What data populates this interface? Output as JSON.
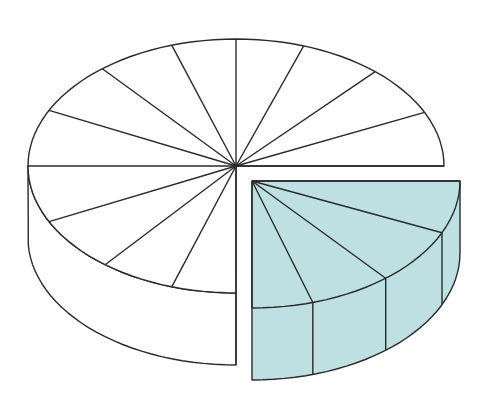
{
  "figure": {
    "caption_fragment": ""
  },
  "colors": {
    "stroke": "#2a2a2a",
    "background": "#ffffff",
    "main_fill": "#ffffff",
    "slice_fill": "#bfe0e3"
  },
  "geometry": {
    "main_center": [
      236,
      166
    ],
    "slice_center": [
      252,
      181
    ],
    "rx": 208,
    "ry": 127,
    "depth": 72
  },
  "main_pie": {
    "start_angle": 90,
    "end_angle": 360,
    "spoke_angles": [
      90,
      108,
      129,
      154,
      180,
      206,
      230,
      252,
      270,
      289,
      312,
      335,
      360
    ]
  },
  "exploded_slice": {
    "start_angle": 0,
    "end_angle": 90,
    "spoke_angles": [
      0,
      24,
      50,
      73,
      90
    ]
  }
}
